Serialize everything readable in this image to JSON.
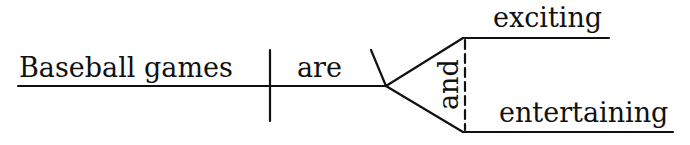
{
  "diagram": {
    "type": "sentence-diagram",
    "subject": "Baseball games",
    "verb": "are",
    "conjunction": "and",
    "predicate_adjectives": [
      "exciting",
      "entertaining"
    ],
    "line_color": "#111111"
  }
}
